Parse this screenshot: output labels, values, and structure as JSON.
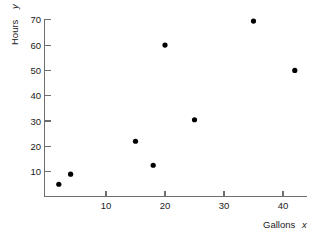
{
  "chart_data": {
    "type": "scatter",
    "title": "",
    "xlabel": "Gallons x",
    "ylabel": "Hours y",
    "xlabel_name": "Gallons",
    "xlabel_var": "x",
    "ylabel_name": "Hours",
    "ylabel_var": "y",
    "xlim": [
      0,
      45
    ],
    "ylim": [
      0,
      74
    ],
    "xticks": [
      10,
      20,
      30,
      40
    ],
    "yticks": [
      10,
      20,
      30,
      40,
      50,
      60,
      70
    ],
    "grid": false,
    "legend": null,
    "point_color": "#000000",
    "axis_color": "#6e6e6e",
    "background": "#ffffff",
    "x": [
      2,
      4,
      15,
      18,
      20,
      25,
      35,
      42
    ],
    "y": [
      5,
      9,
      22,
      12.5,
      60,
      30.5,
      69.5,
      50
    ],
    "points": [
      {
        "x": 2,
        "y": 5
      },
      {
        "x": 4,
        "y": 9
      },
      {
        "x": 15,
        "y": 22
      },
      {
        "x": 18,
        "y": 12.5
      },
      {
        "x": 20,
        "y": 60
      },
      {
        "x": 25,
        "y": 30.5
      },
      {
        "x": 35,
        "y": 69.5
      },
      {
        "x": 42,
        "y": 50
      }
    ]
  }
}
